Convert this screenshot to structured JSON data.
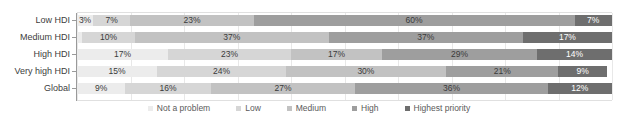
{
  "chart_data": {
    "type": "bar",
    "subtype": "100% stacked horizontal bar",
    "title": "",
    "subtitle": "",
    "xlabel": "",
    "ylabel": "",
    "xlim": [
      0,
      100
    ],
    "grid": true,
    "legend_position": "bottom-center",
    "categories": [
      "Low HDI",
      "Medium HDI",
      "High HDI",
      "Very high HDI",
      "Global"
    ],
    "series": [
      {
        "name": "Not a problem",
        "color": "#ececec",
        "values": [
          3,
          1,
          17,
          15,
          9
        ]
      },
      {
        "name": "Low",
        "color": "#d6d6d6",
        "values": [
          7,
          10,
          23,
          24,
          16
        ]
      },
      {
        "name": "Medium",
        "color": "#c2c2c2",
        "values": [
          23,
          37,
          17,
          30,
          27
        ]
      },
      {
        "name": "High",
        "color": "#9e9e9e",
        "values": [
          60,
          37,
          29,
          21,
          36
        ]
      },
      {
        "name": "Highest priority",
        "color": "#6e6e6e",
        "values": [
          7,
          17,
          14,
          9,
          12
        ]
      }
    ],
    "data_labels": [
      {
        "category": "Low HDI",
        "labels": [
          "3%",
          "7%",
          "23%",
          "60%",
          "7%"
        ]
      },
      {
        "category": "Medium HDI",
        "labels": [
          "",
          "10%",
          "37%",
          "37%",
          "17%"
        ]
      },
      {
        "category": "High HDI",
        "labels": [
          "17%",
          "23%",
          "17%",
          "29%",
          "14%"
        ]
      },
      {
        "category": "Very high HDI",
        "labels": [
          "15%",
          "24%",
          "30%",
          "21%",
          "9%"
        ]
      },
      {
        "category": "Global",
        "labels": [
          "9%",
          "16%",
          "27%",
          "36%",
          "12%"
        ]
      }
    ],
    "gridline_positions": [
      0,
      10,
      20,
      30,
      40,
      50,
      60,
      70,
      80,
      90,
      100
    ]
  },
  "legend": {
    "items": [
      {
        "label": "Not a problem",
        "color": "#ececec"
      },
      {
        "label": "Low",
        "color": "#d6d6d6"
      },
      {
        "label": "Medium",
        "color": "#c2c2c2"
      },
      {
        "label": "High",
        "color": "#9e9e9e"
      },
      {
        "label": "Highest priority",
        "color": "#6e6e6e"
      }
    ]
  },
  "axis": {
    "line_color": "#9a9a9a",
    "grid_color": "#e8e8e8"
  }
}
